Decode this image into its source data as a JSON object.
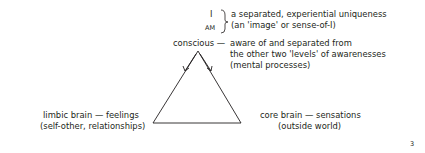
{
  "top": {
    "i_label": "I",
    "am_label": "AM",
    "brace_line1": "a separated, experiential uniqueness",
    "brace_line2": "(an 'image' or sense-of-I)"
  },
  "conscious": {
    "label": "conscious —",
    "desc_line1": "aware of and separated from",
    "desc_line2": "the other two 'levels' of awarenesses",
    "desc_line3": "(mental processes)"
  },
  "limbic": {
    "line1": "limbic brain — feelings",
    "line2": "(self-other, relationships)"
  },
  "core": {
    "line1": "core brain — sensations",
    "line2": "(outside world)"
  },
  "page_number": "3",
  "colors": {
    "ink": "#231f20",
    "background": "#ffffff"
  }
}
